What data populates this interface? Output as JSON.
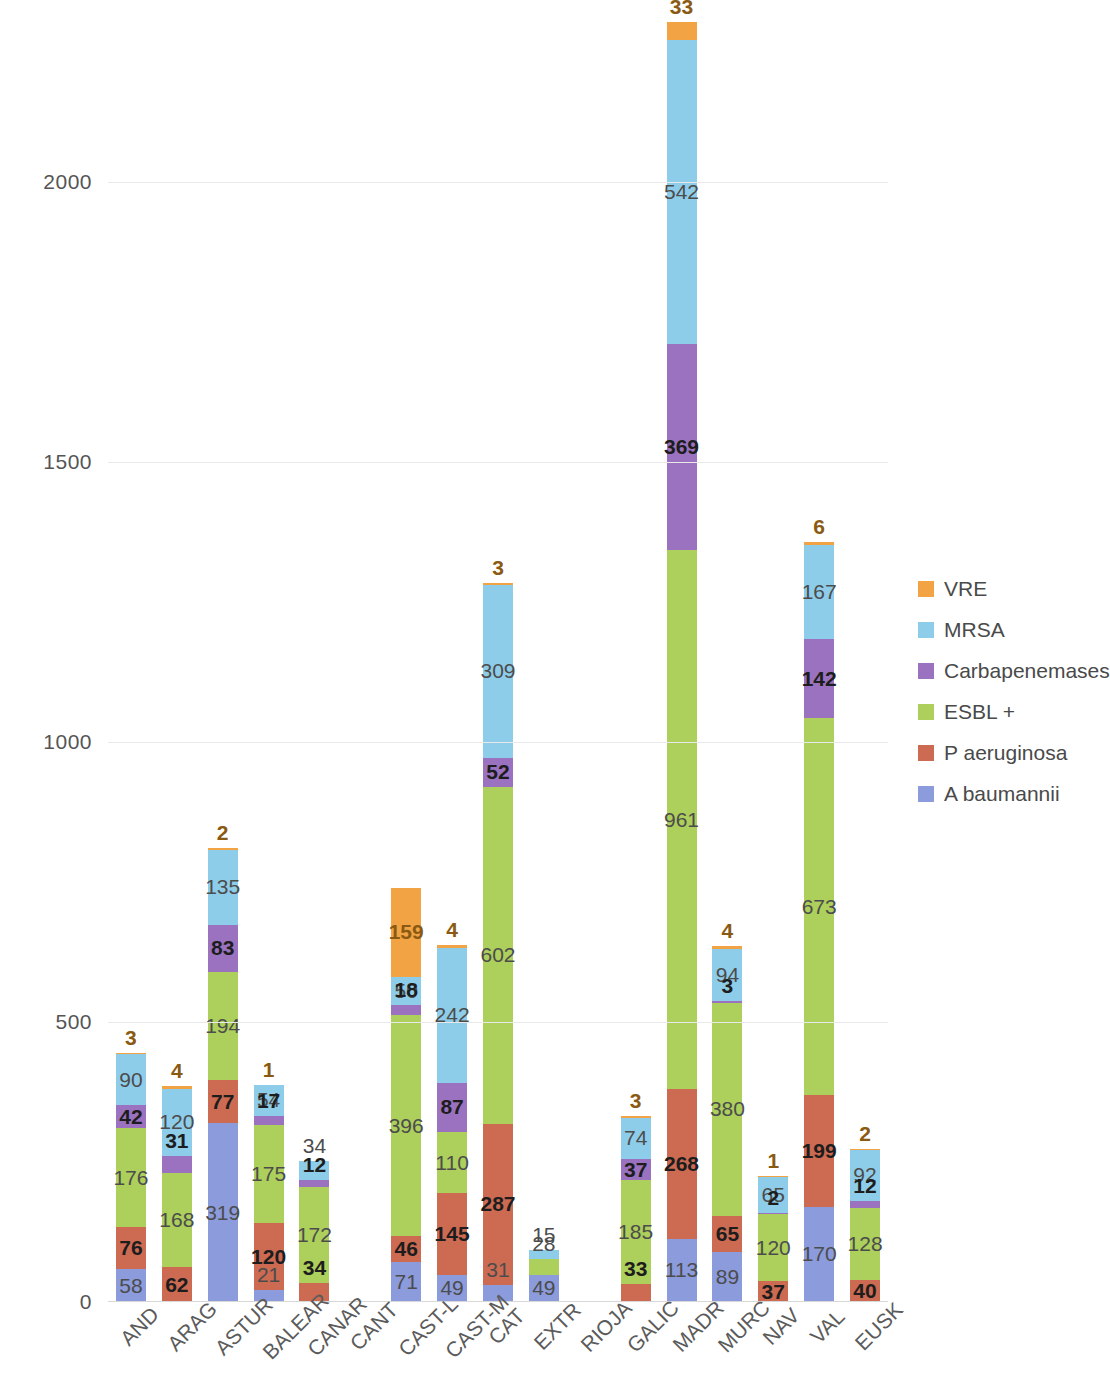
{
  "chart_data": {
    "type": "bar",
    "stacked": true,
    "title": "",
    "subtitle": "",
    "xlabel": "",
    "ylabel": "",
    "ylim": [
      0,
      2300
    ],
    "yticks": [
      0,
      500,
      1000,
      1500,
      2000
    ],
    "ytick_labels": [
      "0",
      "500",
      "1000",
      "1500",
      "2000"
    ],
    "grid": true,
    "legend_position": "right",
    "categories": [
      "AND",
      "ARAG",
      "ASTUR",
      "BALEAR",
      "CANAR",
      "CANT",
      "CAST-L",
      "CAST-M",
      "CAT",
      "EXTR",
      "RIOJA",
      "GALIC",
      "MADR",
      "MURC",
      "NAV",
      "VAL",
      "EUSK"
    ],
    "series": [
      {
        "name": "A baumannii",
        "color": "#8b9bdc",
        "values": [
          58,
          0,
          319,
          21,
          0,
          0,
          71,
          49,
          31,
          49,
          0,
          0,
          113,
          89,
          0,
          170,
          0
        ]
      },
      {
        "name": "P aeruginosa",
        "color": "#cd6a52",
        "values": [
          76,
          62,
          77,
          120,
          34,
          0,
          46,
          145,
          287,
          0,
          0,
          33,
          268,
          65,
          37,
          199,
          40
        ]
      },
      {
        "name": "ESBL +",
        "color": "#adcf5b",
        "values": [
          176,
          168,
          194,
          175,
          172,
          0,
          396,
          110,
          602,
          28,
          0,
          185,
          961,
          380,
          120,
          673,
          128
        ]
      },
      {
        "name": "Carbapenemases",
        "color": "#9b72c0",
        "values": [
          42,
          31,
          83,
          17,
          12,
          0,
          18,
          87,
          52,
          0,
          0,
          37,
          369,
          3,
          2,
          142,
          12
        ]
      },
      {
        "name": "MRSA",
        "color": "#8ecdea",
        "values": [
          90,
          120,
          135,
          54,
          34,
          0,
          50,
          242,
          309,
          15,
          0,
          74,
          542,
          94,
          65,
          167,
          92
        ]
      },
      {
        "name": "VRE",
        "color": "#f2a444",
        "values": [
          3,
          4,
          2,
          1,
          0,
          0,
          159,
          4,
          3,
          0,
          0,
          3,
          33,
          4,
          1,
          6,
          2
        ]
      }
    ],
    "totals": [
      445,
      385,
      810,
      388,
      252,
      0,
      740,
      637,
      1284,
      92,
      0,
      332,
      2286,
      635,
      225,
      1357,
      274
    ]
  },
  "legend": {
    "items": [
      {
        "label": "VRE",
        "color": "#f2a444"
      },
      {
        "label": "MRSA",
        "color": "#8ecdea"
      },
      {
        "label": "Carbapenemases",
        "color": "#9b72c0"
      },
      {
        "label": "ESBL +",
        "color": "#adcf5b"
      },
      {
        "label": "P aeruginosa",
        "color": "#cd6a52"
      },
      {
        "label": "A baumannii",
        "color": "#8b9bdc"
      }
    ]
  }
}
